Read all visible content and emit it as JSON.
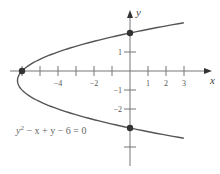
{
  "chart_data": {
    "type": "line",
    "title": "",
    "equation": "y² − x + y − 6 = 0",
    "xlabel": "x",
    "ylabel": "y",
    "xlim": [
      -6.5,
      4.4
    ],
    "ylim": [
      -4.9,
      3.2
    ],
    "x_ticks": [
      -6,
      -5,
      -4,
      -3,
      -2,
      -1,
      1,
      2,
      3
    ],
    "x_tick_labels": [
      {
        "value": -4,
        "label": "−4"
      },
      {
        "value": -2,
        "label": "−2"
      },
      {
        "value": 1,
        "label": "1"
      },
      {
        "value": 2,
        "label": "2"
      },
      {
        "value": 3,
        "label": "3"
      }
    ],
    "y_ticks": [
      1,
      -1,
      -2,
      -4
    ],
    "y_tick_labels": [
      {
        "value": 1,
        "label": "1"
      },
      {
        "value": -1,
        "label": "−1"
      },
      {
        "value": -2,
        "label": "−2"
      }
    ],
    "series": [
      {
        "name": "y^2 - x + y - 6 = 0",
        "relation": "x = y^2 + y - 6",
        "y_range": [
          -3.54,
          2.54
        ],
        "color": "#555555"
      }
    ],
    "points": [
      {
        "x": -6,
        "y": 0,
        "label": "x-intercept"
      },
      {
        "x": 0,
        "y": 2,
        "label": "y-intercept"
      },
      {
        "x": 0,
        "y": -3,
        "label": "y-intercept"
      }
    ],
    "grid": false,
    "legend": "none"
  },
  "labels": {
    "x_axis": "x",
    "y_axis": "y",
    "equation": "y² − x + y − 6 = 0"
  }
}
